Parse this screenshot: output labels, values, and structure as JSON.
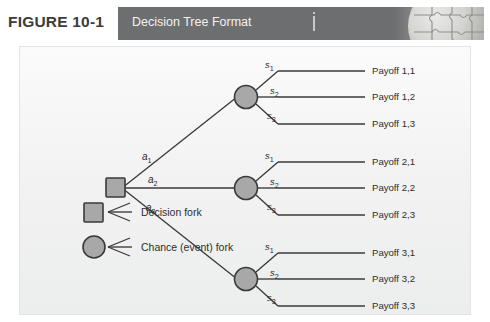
{
  "figure": {
    "number": "FIGURE 10-1",
    "banner_title": "Decision Tree Format"
  },
  "colors": {
    "banner_bg": "#6d6e70",
    "banner_text": "#f2f2f2",
    "panel_bg": "#f3f3f3",
    "node_fill": "#a8a8a8",
    "node_stroke": "#3a3a3a",
    "line": "#3a3a3a",
    "text": "#2e2e2e"
  },
  "diagram": {
    "type": "decision-tree",
    "decision_node": {
      "shape": "square",
      "name": "decision-fork"
    },
    "branches": [
      {
        "action_label": "a",
        "action_sub": "1",
        "chance_node": {
          "shape": "circle",
          "name": "chance-fork"
        },
        "outcomes": [
          {
            "state": "s",
            "state_sub": "1",
            "payoff": "Payoff 1,1"
          },
          {
            "state": "s",
            "state_sub": "2",
            "payoff": "Payoff 1,2"
          },
          {
            "state": "s",
            "state_sub": "3",
            "payoff": "Payoff 1,3"
          }
        ]
      },
      {
        "action_label": "a",
        "action_sub": "2",
        "chance_node": {
          "shape": "circle",
          "name": "chance-fork"
        },
        "outcomes": [
          {
            "state": "s",
            "state_sub": "1",
            "payoff": "Payoff 2,1"
          },
          {
            "state": "s",
            "state_sub": "2",
            "payoff": "Payoff 2,2"
          },
          {
            "state": "s",
            "state_sub": "3",
            "payoff": "Payoff 2,3"
          }
        ]
      },
      {
        "action_label": "a",
        "action_sub": "3",
        "chance_node": {
          "shape": "circle",
          "name": "chance-fork"
        },
        "outcomes": [
          {
            "state": "s",
            "state_sub": "1",
            "payoff": "Payoff 3,1"
          },
          {
            "state": "s",
            "state_sub": "2",
            "payoff": "Payoff 3,2"
          },
          {
            "state": "s",
            "state_sub": "3",
            "payoff": "Payoff 3,3"
          }
        ]
      }
    ]
  },
  "legend": {
    "items": [
      {
        "icon": "square-fork-icon",
        "label": "Decision fork"
      },
      {
        "icon": "circle-fork-icon",
        "label": "Chance (event) fork"
      }
    ]
  }
}
